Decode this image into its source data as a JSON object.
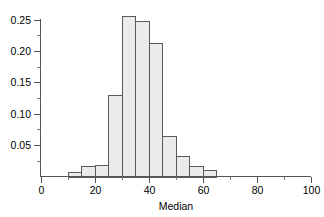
{
  "chart_data": {
    "type": "bar",
    "title": "",
    "subtitle": "",
    "xlabel": "Median",
    "ylabel": "",
    "xlim": [
      0,
      100
    ],
    "ylim": [
      0,
      0.26
    ],
    "grid": false,
    "legend": null,
    "bin_width": 5,
    "categories": [
      "10-15",
      "15-20",
      "20-25",
      "25-30",
      "30-35",
      "35-40",
      "40-45",
      "45-50",
      "50-55",
      "55-60",
      "60-65"
    ],
    "bin_edges": [
      10,
      15,
      20,
      25,
      30,
      35,
      40,
      45,
      50,
      55,
      60,
      65
    ],
    "values": [
      0.007,
      0.016,
      0.019,
      0.13,
      0.255,
      0.248,
      0.212,
      0.065,
      0.032,
      0.017,
      0.01
    ],
    "x_ticks_major": [
      0,
      20,
      40,
      60,
      80,
      100
    ],
    "x_tick_labels": [
      "0",
      "20",
      "40",
      "60",
      "80",
      "100"
    ],
    "x_ticks_minor": [
      10,
      30,
      50,
      70,
      90
    ],
    "y_ticks_major": [
      0.05,
      0.1,
      0.15,
      0.2,
      0.25
    ],
    "y_tick_labels": [
      "0.05",
      "0.10",
      "0.15",
      "0.20",
      "0.25"
    ],
    "y_ticks_minor": [
      0.025,
      0.075,
      0.125,
      0.175,
      0.225
    ],
    "colors": {
      "bar_fill": "#ebebeb",
      "bar_stroke": "#5a5a5a",
      "axis": "#555555",
      "tick_minor": "#777777",
      "text": "#000000",
      "background": "#ffffff"
    }
  },
  "axis_title": {
    "x": "Median"
  }
}
